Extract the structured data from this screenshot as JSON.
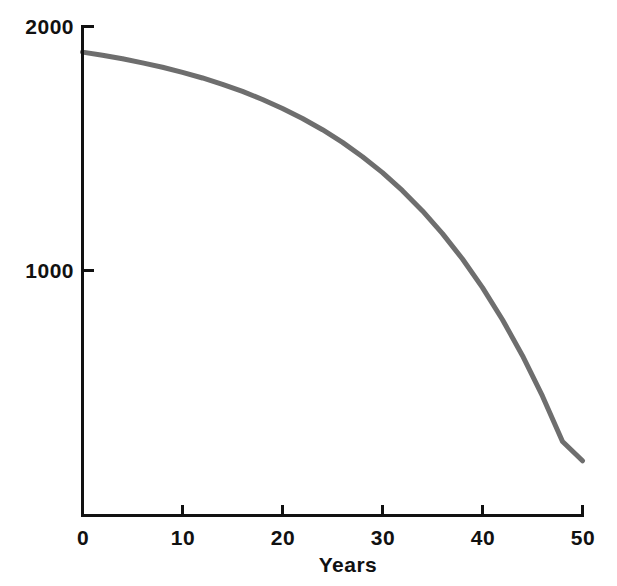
{
  "chart_data": {
    "type": "line",
    "title": "",
    "xlabel": "Years",
    "ylabel": "",
    "xlim": [
      0,
      50
    ],
    "ylim": [
      0,
      2000
    ],
    "grid": false,
    "legend": null,
    "x_ticks": [
      {
        "value": 0,
        "label": "0"
      },
      {
        "value": 10,
        "label": "10"
      },
      {
        "value": 20,
        "label": "20"
      },
      {
        "value": 30,
        "label": "30"
      },
      {
        "value": 40,
        "label": "40"
      },
      {
        "value": 50,
        "label": "50"
      }
    ],
    "y_ticks": [
      {
        "value": 1000,
        "label": "1000"
      },
      {
        "value": 2000,
        "label": "2000"
      }
    ],
    "series": [
      {
        "name": "growth-curve",
        "color": "#6e6e6e",
        "line_width": 5,
        "x": [
          0,
          2,
          4,
          6,
          8,
          10,
          12,
          14,
          16,
          18,
          20,
          22,
          24,
          26,
          28,
          30,
          32,
          34,
          36,
          38,
          40,
          42,
          44,
          46,
          48,
          50
        ],
        "values": [
          105,
          118,
          132,
          149,
          167,
          188,
          211,
          237,
          266,
          299,
          336,
          377,
          423,
          475,
          534,
          599,
          673,
          756,
          849,
          953,
          1070,
          1202,
          1349,
          1515,
          1701,
          1780
        ]
      }
    ],
    "annotations": []
  },
  "axis": {
    "line_color": "#111111",
    "line_width": 3,
    "tick_length": 11
  },
  "labels": {
    "x_axis_title": "Years",
    "y_top": "2000",
    "y_mid": "1000",
    "x0": "0",
    "x10": "10",
    "x20": "20",
    "x30": "30",
    "x40": "40",
    "x50": "50"
  }
}
